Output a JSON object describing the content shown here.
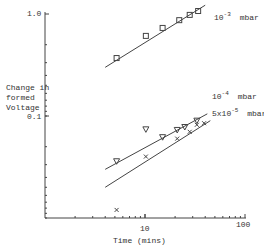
{
  "chart_data": {
    "type": "line",
    "title": "",
    "xlabel": "Time (mins)",
    "ylabel": "Change in formed Voltage",
    "xscale": "log",
    "yscale": "log",
    "xlim": [
      1,
      100
    ],
    "ylim": [
      0.01,
      1.0
    ],
    "x_ticks": [
      {
        "value": 10,
        "label": "10"
      },
      {
        "value": 100,
        "label": "100"
      }
    ],
    "y_ticks": [
      {
        "value": 1.0,
        "label": "1.0"
      },
      {
        "value": 0.1,
        "label": "0.1"
      }
    ],
    "grid": false,
    "legend": "inline labels at line ends",
    "series": [
      {
        "name": "10^-3 mbar",
        "label_base": "10",
        "label_exp": "-3",
        "label_unit": "mbar",
        "marker": "square",
        "points": [
          [
            5.2,
            0.37
          ],
          [
            10.2,
            0.61
          ],
          [
            15,
            0.73
          ],
          [
            22,
            0.87
          ],
          [
            28,
            0.98
          ],
          [
            34,
            1.07
          ]
        ],
        "fit_line": [
          [
            4.0,
            0.3
          ],
          [
            40,
            1.22
          ]
        ]
      },
      {
        "name": "10^-4 mbar",
        "label_base": "10",
        "label_exp": "-4",
        "label_unit": "mbar",
        "marker": "triangle-down",
        "points": [
          [
            5.2,
            0.036
          ],
          [
            10.2,
            0.074
          ],
          [
            15,
            0.062
          ],
          [
            21,
            0.073
          ],
          [
            25,
            0.078
          ],
          [
            33,
            0.09
          ]
        ],
        "fit_line": [
          [
            4.0,
            0.03
          ],
          [
            42,
            0.105
          ]
        ]
      },
      {
        "name": "5x10^-5 mbar",
        "label_base": "5x10",
        "label_exp": "-5",
        "label_unit": "mbar",
        "marker": "x",
        "points": [
          [
            5.2,
            0.012
          ],
          [
            10.2,
            0.04
          ],
          [
            21,
            0.06
          ],
          [
            28,
            0.07
          ],
          [
            33,
            0.082
          ],
          [
            39,
            0.085
          ]
        ],
        "fit_line": [
          [
            4.0,
            0.02
          ],
          [
            45,
            0.09
          ]
        ]
      }
    ]
  },
  "axes": {
    "y_label_lines": [
      "Change in",
      "formed",
      "Voltage"
    ],
    "x_label": "Time (mins)",
    "y_tick_top": "1.0",
    "y_tick_mid": "0.1",
    "x_tick_10": "10",
    "x_tick_100": "100"
  },
  "labels": {
    "s1_base": "10",
    "s1_exp": "-3",
    "s1_unit": "mbar",
    "s2_base": "10",
    "s2_exp": "-4",
    "s2_unit": "mbar",
    "s3_base": "5x10",
    "s3_exp": "-5",
    "s3_unit": "mbar"
  },
  "colors": {
    "ink": "#333333",
    "background": "#ffffff"
  }
}
